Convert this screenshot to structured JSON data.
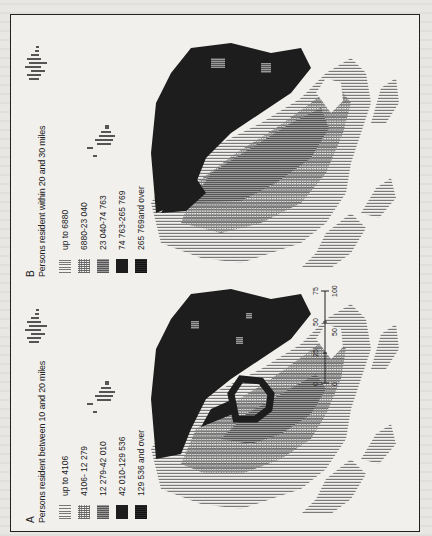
{
  "figure": {
    "panels": [
      {
        "letter": "A",
        "title": "Persons resident between 10 and 20 miles",
        "legend": [
          {
            "label": "up to 4106",
            "pattern": "light-vertical-hatch"
          },
          {
            "label": "4106- 12 279",
            "pattern": "cross-hatch"
          },
          {
            "label": "12 279-42 010",
            "pattern": "medium-grey"
          },
          {
            "label": "42 010-129 536",
            "pattern": "dark"
          },
          {
            "label": "129 536 and over",
            "pattern": "black"
          }
        ]
      },
      {
        "letter": "B",
        "title": "Persons resident within 20 and 30 miles",
        "legend": [
          {
            "label": "up to 6880",
            "pattern": "light-vertical-hatch"
          },
          {
            "label": "6880-23 040",
            "pattern": "cross-hatch"
          },
          {
            "label": "23 040-74 763",
            "pattern": "medium-grey"
          },
          {
            "label": "74 763-265 769",
            "pattern": "dark"
          },
          {
            "label": "265 769and over",
            "pattern": "black"
          }
        ]
      }
    ],
    "scale_bar": {
      "miles_label": "miles",
      "km_label": "km",
      "miles_ticks": [
        "0",
        "25",
        "50",
        "75"
      ],
      "km_ticks": [
        "0",
        "50",
        "100"
      ]
    },
    "colors": {
      "ink": "#1d1d1d",
      "paper": "#f1f0ed",
      "light": "#8a8a8a",
      "medium": "#6a6a6a"
    }
  }
}
